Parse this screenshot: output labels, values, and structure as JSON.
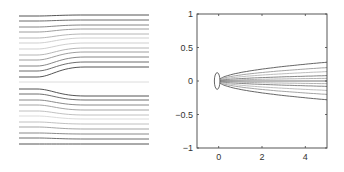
{
  "chart_data": [
    {
      "type": "line",
      "title": "",
      "description": "Streamlines flowing left to right, deflecting around a centerline; no axes shown",
      "xlabel": "",
      "ylabel": "",
      "axes_visible": false,
      "grid": false,
      "frame": {
        "left": 19,
        "right": 149,
        "top": 15,
        "bottom": 145
      },
      "streamlines": {
        "count": 24,
        "upper_start_y": [
          16,
          21,
          27,
          32,
          38,
          43,
          49,
          55,
          60,
          66,
          71,
          77
        ],
        "upper_end_y": [
          15,
          20,
          25,
          29,
          34,
          38,
          43,
          48,
          52,
          57,
          62,
          67
        ],
        "lower_start_y": [
          89,
          94,
          100,
          105,
          111,
          116,
          122,
          127,
          133,
          138,
          144
        ],
        "lower_end_y": [
          96,
          100,
          105,
          110,
          115,
          119,
          124,
          129,
          134,
          139,
          144
        ],
        "center_y": 82
      }
    },
    {
      "type": "line",
      "title": "",
      "subtype": "contour",
      "xlabel": "",
      "ylabel": "",
      "xlim": [
        -1,
        5
      ],
      "ylim": [
        -1,
        1
      ],
      "xticks": [
        "0",
        "2",
        "4"
      ],
      "xtick_values": [
        0,
        2,
        4
      ],
      "yticks": [
        "1",
        "0.5",
        "0",
        "−0.5",
        "−1"
      ],
      "ytick_values": [
        1,
        0.5,
        0,
        -0.5,
        -1
      ],
      "grid": false,
      "series": [
        {
          "name": "contour-outer",
          "half_width_at_x5": 0.28
        },
        {
          "name": "contour-2",
          "half_width_at_x5": 0.2
        },
        {
          "name": "contour-3",
          "half_width_at_x5": 0.14
        },
        {
          "name": "contour-4",
          "half_width_at_x5": 0.08
        },
        {
          "name": "contour-inner",
          "half_width_at_x5": 0.04
        }
      ],
      "nose": {
        "x": 0,
        "y": 0,
        "width": 0.2,
        "height": 0.25
      }
    }
  ]
}
